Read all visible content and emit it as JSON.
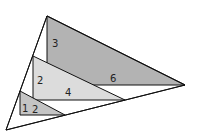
{
  "diagram": {
    "colors": {
      "outline": "#111111",
      "large_fill": "#b3b3b3",
      "medium_fill": "#dcdcdc",
      "small_fill": "#c4c4c4",
      "background": "#ffffff"
    },
    "outer_triangle": {
      "points": "47,16 6,130 185,85"
    },
    "triangles": [
      {
        "id": "large",
        "points": "47,16 47,85 185,85",
        "leg_label": "3",
        "base_label": "6",
        "leg_pos": [
          54,
          45
        ],
        "base_pos": [
          113,
          79
        ]
      },
      {
        "id": "medium",
        "points": "33,56 33,100 125,100",
        "leg_label": "2",
        "base_label": "4",
        "leg_pos": [
          38,
          83
        ],
        "base_pos": [
          66,
          94
        ]
      },
      {
        "id": "small",
        "points": "20,91 20,115 65,115",
        "leg_label": "1",
        "base_label": "2",
        "leg_pos": [
          23,
          111
        ],
        "base_pos": [
          32,
          112
        ]
      }
    ]
  }
}
